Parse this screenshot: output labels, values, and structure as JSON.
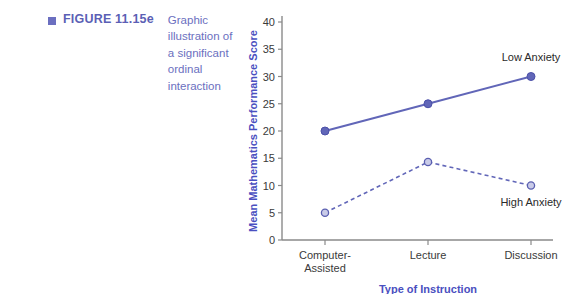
{
  "figure": {
    "bullet_icon": "square-bullet-icon",
    "label": "FIGURE 11.15e",
    "description": "Graphic illustration of a significant ordinal interaction"
  },
  "chart_data": {
    "type": "line",
    "title": "",
    "xlabel": "Type of Instruction",
    "ylabel": "Mean Mathematics Performance Score",
    "categories": [
      "Computer-Assisted",
      "Lecture",
      "Discussion"
    ],
    "category_lines": [
      [
        "Computer-",
        "Assisted"
      ],
      [
        "Lecture"
      ],
      [
        "Discussion"
      ]
    ],
    "ylim": [
      0,
      40
    ],
    "yticks": [
      0,
      5,
      10,
      15,
      20,
      25,
      30,
      35,
      40
    ],
    "ytick_labels": [
      "0",
      "5",
      "10",
      "15",
      "20",
      "25",
      "30",
      "35",
      "40"
    ],
    "grid": false,
    "legend_position": "inline-annotation",
    "series": [
      {
        "name": "Low Anxiety",
        "values": [
          20,
          25,
          30
        ],
        "line_style": "solid",
        "marker": "filled-circle",
        "color": "#6166b8",
        "label_anchor_index": 2,
        "label_offset_y": -16
      },
      {
        "name": "High Anxiety",
        "values": [
          5,
          14.3,
          10
        ],
        "line_style": "dashed",
        "marker": "hollow-circle",
        "color": "#6166b8",
        "label_anchor_index": 2,
        "label_offset_y": 20
      }
    ]
  },
  "colors": {
    "accent": "#6166b8",
    "caption": "#6b6fc0",
    "axis_title": "#4a4fc0",
    "axis_line": "#8a8a8a",
    "tick_text": "#3a3a3a"
  }
}
